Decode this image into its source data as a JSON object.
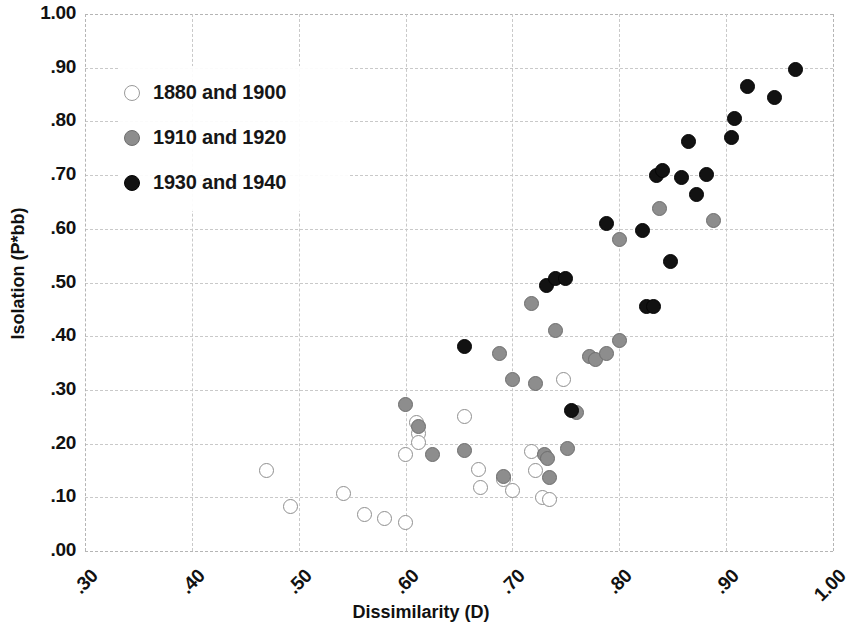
{
  "chart_data": {
    "type": "scatter",
    "title": "",
    "xlabel": "Dissimilarity (D)",
    "ylabel": "Isolation (P*bb)",
    "xlim": [
      0.3,
      1.0
    ],
    "ylim": [
      0.0,
      1.0
    ],
    "xticks": [
      ".30",
      ".40",
      ".50",
      ".60",
      ".70",
      ".80",
      ".90",
      "1.00"
    ],
    "yticks": [
      "1.00",
      ".90",
      ".80",
      ".70",
      ".60",
      ".50",
      ".40",
      ".30",
      ".20",
      ".10",
      ".00"
    ],
    "grid": true,
    "legend_position": "upper-left-inside",
    "series": [
      {
        "name": "1880 and 1900",
        "marker": "open-circle",
        "color": "#ffffff",
        "edge_color": "#8f8f8f",
        "points": [
          {
            "x": 0.47,
            "y": 0.15
          },
          {
            "x": 0.492,
            "y": 0.083
          },
          {
            "x": 0.542,
            "y": 0.107
          },
          {
            "x": 0.562,
            "y": 0.068
          },
          {
            "x": 0.58,
            "y": 0.06
          },
          {
            "x": 0.6,
            "y": 0.054
          },
          {
            "x": 0.6,
            "y": 0.18
          },
          {
            "x": 0.61,
            "y": 0.24
          },
          {
            "x": 0.612,
            "y": 0.218
          },
          {
            "x": 0.612,
            "y": 0.202
          },
          {
            "x": 0.655,
            "y": 0.25
          },
          {
            "x": 0.668,
            "y": 0.152
          },
          {
            "x": 0.67,
            "y": 0.118
          },
          {
            "x": 0.692,
            "y": 0.133
          },
          {
            "x": 0.7,
            "y": 0.112
          },
          {
            "x": 0.718,
            "y": 0.185
          },
          {
            "x": 0.722,
            "y": 0.15
          },
          {
            "x": 0.728,
            "y": 0.1
          },
          {
            "x": 0.735,
            "y": 0.096
          },
          {
            "x": 0.748,
            "y": 0.32
          }
        ]
      },
      {
        "name": "1910 and 1920",
        "marker": "filled-gray-circle",
        "color": "#8d8d8d",
        "edge_color": "#6e6e6e",
        "points": [
          {
            "x": 0.6,
            "y": 0.273
          },
          {
            "x": 0.612,
            "y": 0.232
          },
          {
            "x": 0.625,
            "y": 0.18
          },
          {
            "x": 0.655,
            "y": 0.188
          },
          {
            "x": 0.688,
            "y": 0.367
          },
          {
            "x": 0.692,
            "y": 0.138
          },
          {
            "x": 0.7,
            "y": 0.32
          },
          {
            "x": 0.718,
            "y": 0.46
          },
          {
            "x": 0.722,
            "y": 0.312
          },
          {
            "x": 0.73,
            "y": 0.18
          },
          {
            "x": 0.733,
            "y": 0.172
          },
          {
            "x": 0.735,
            "y": 0.136
          },
          {
            "x": 0.74,
            "y": 0.41
          },
          {
            "x": 0.752,
            "y": 0.19
          },
          {
            "x": 0.76,
            "y": 0.258
          },
          {
            "x": 0.772,
            "y": 0.362
          },
          {
            "x": 0.778,
            "y": 0.357
          },
          {
            "x": 0.788,
            "y": 0.368
          },
          {
            "x": 0.8,
            "y": 0.392
          },
          {
            "x": 0.8,
            "y": 0.58
          },
          {
            "x": 0.838,
            "y": 0.638
          },
          {
            "x": 0.888,
            "y": 0.615
          }
        ]
      },
      {
        "name": "1930 and 1940",
        "marker": "filled-black-circle",
        "color": "#121212",
        "edge_color": "#050505",
        "points": [
          {
            "x": 0.655,
            "y": 0.38
          },
          {
            "x": 0.732,
            "y": 0.495
          },
          {
            "x": 0.74,
            "y": 0.508
          },
          {
            "x": 0.75,
            "y": 0.508
          },
          {
            "x": 0.755,
            "y": 0.262
          },
          {
            "x": 0.788,
            "y": 0.61
          },
          {
            "x": 0.822,
            "y": 0.596
          },
          {
            "x": 0.825,
            "y": 0.455
          },
          {
            "x": 0.832,
            "y": 0.456
          },
          {
            "x": 0.835,
            "y": 0.7
          },
          {
            "x": 0.84,
            "y": 0.708
          },
          {
            "x": 0.848,
            "y": 0.54
          },
          {
            "x": 0.858,
            "y": 0.695
          },
          {
            "x": 0.865,
            "y": 0.762
          },
          {
            "x": 0.872,
            "y": 0.663
          },
          {
            "x": 0.882,
            "y": 0.702
          },
          {
            "x": 0.905,
            "y": 0.77
          },
          {
            "x": 0.908,
            "y": 0.806
          },
          {
            "x": 0.92,
            "y": 0.865
          },
          {
            "x": 0.945,
            "y": 0.845
          },
          {
            "x": 0.965,
            "y": 0.896
          }
        ]
      }
    ]
  },
  "axes": {
    "x_title": "Dissimilarity (D)",
    "y_title": "Isolation (P*bb)"
  },
  "legend": {
    "items": [
      {
        "label": "1880 and 1900",
        "swatch": "open-circle-marker"
      },
      {
        "label": "1910 and 1920",
        "swatch": "gray-circle-marker"
      },
      {
        "label": "1930 and 1940",
        "swatch": "black-circle-marker"
      }
    ]
  }
}
